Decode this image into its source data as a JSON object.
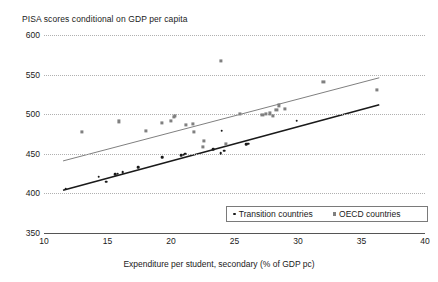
{
  "chart_data": {
    "type": "scatter",
    "title": "PISA scores conditional on GDP per capita",
    "xlabel": "Expenditure per student, secondary (% of GDP pc)",
    "ylabel": "",
    "xlim": [
      10,
      40
    ],
    "ylim": [
      350,
      600
    ],
    "xticks": [
      10,
      15,
      20,
      25,
      30,
      35,
      40
    ],
    "yticks": [
      350,
      400,
      450,
      500,
      550,
      600
    ],
    "grid": "horizontal-dotted",
    "legend_position": "bottom-right",
    "legend": [
      {
        "label": "Transition countries",
        "marker": "dot",
        "color": "#1a1a1a"
      },
      {
        "label": "OECD countries",
        "marker": "square",
        "color": "#808080"
      }
    ],
    "series": [
      {
        "name": "Transition countries",
        "marker": "dot",
        "color": "#1a1a1a",
        "points": [
          [
            11.7,
            406
          ],
          [
            14.3,
            421
          ],
          [
            14.9,
            415
          ],
          [
            15.6,
            424
          ],
          [
            15.8,
            425
          ],
          [
            16.2,
            427
          ],
          [
            17.4,
            433
          ],
          [
            19.3,
            446
          ],
          [
            20.8,
            448
          ],
          [
            21.0,
            449
          ],
          [
            21.1,
            450
          ],
          [
            23.3,
            456
          ],
          [
            23.9,
            451
          ],
          [
            24.2,
            454
          ],
          [
            24.0,
            479
          ],
          [
            25.9,
            462
          ],
          [
            26.1,
            463
          ],
          [
            29.9,
            492
          ]
        ],
        "trendline": {
          "x": [
            11.5,
            36.4
          ],
          "y": [
            404,
            512
          ]
        }
      },
      {
        "name": "OECD countries",
        "marker": "square",
        "color": "#808080",
        "points": [
          [
            13.0,
            478
          ],
          [
            15.9,
            491
          ],
          [
            18.0,
            479
          ],
          [
            19.3,
            489
          ],
          [
            20.0,
            492
          ],
          [
            20.2,
            497
          ],
          [
            20.3,
            498
          ],
          [
            21.2,
            486
          ],
          [
            21.7,
            488
          ],
          [
            21.8,
            478
          ],
          [
            22.5,
            459
          ],
          [
            22.6,
            466
          ],
          [
            23.9,
            567
          ],
          [
            24.3,
            463
          ],
          [
            25.4,
            500
          ],
          [
            27.2,
            499
          ],
          [
            27.5,
            500
          ],
          [
            27.8,
            501
          ],
          [
            28.0,
            498
          ],
          [
            28.3,
            505
          ],
          [
            28.5,
            511
          ],
          [
            29.0,
            507
          ],
          [
            32.0,
            541
          ],
          [
            36.2,
            531
          ]
        ],
        "trendline": {
          "x": [
            11.5,
            36.4
          ],
          "y": [
            441,
            546
          ]
        }
      }
    ]
  },
  "legend": {
    "transition_label": "Transition countries",
    "oecd_label": "OECD countries"
  }
}
